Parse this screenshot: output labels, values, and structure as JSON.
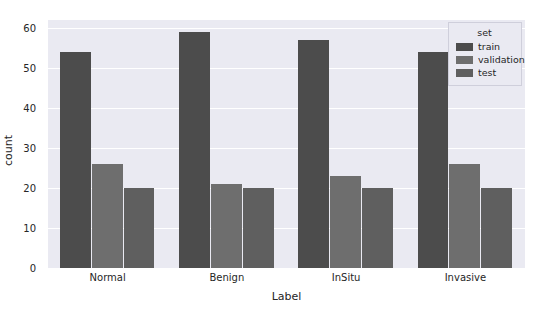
{
  "chart_data": {
    "type": "bar",
    "title": "",
    "xlabel": "Label",
    "ylabel": "count",
    "categories": [
      "Normal",
      "Benign",
      "InSitu",
      "Invasive"
    ],
    "series": [
      {
        "name": "train",
        "values": [
          54,
          59,
          57,
          54
        ],
        "color": "#4c4c4c"
      },
      {
        "name": "validation",
        "values": [
          26,
          21,
          23,
          26
        ],
        "color": "#6e6e6e"
      },
      {
        "name": "test",
        "values": [
          20,
          20,
          20,
          20
        ],
        "color": "#5f5f5f"
      }
    ],
    "ylim": [
      0,
      62
    ],
    "yticks": [
      0,
      10,
      20,
      30,
      40,
      50,
      60
    ],
    "ytick_labels": [
      "0",
      "10",
      "20",
      "30",
      "40",
      "50",
      "60"
    ],
    "grid": true,
    "legend": {
      "title": "set",
      "position": "upper right",
      "entries": [
        "train",
        "validation",
        "test"
      ]
    },
    "style": {
      "plot_background": "#eaeaf2",
      "figure_background": "#ffffff",
      "gridline_color": "#ffffff",
      "text_color": "#262626"
    }
  }
}
